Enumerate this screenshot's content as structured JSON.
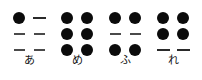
{
  "chart_data": {
    "type": "table",
    "title": "",
    "xlabel": "",
    "ylabel": "",
    "categories": [
      "あ",
      "め",
      "ふ",
      "れ"
    ],
    "dot_rows": 3,
    "dot_cols": 2,
    "legend": [],
    "colors": {
      "dot_filled": "#0b0b0b",
      "dot_empty": "#4a4a4a",
      "background": "#ffffff",
      "label_text": "#111111"
    },
    "cells": [
      {
        "label": "あ",
        "romaji": "a",
        "dots": [
          [
            1,
            0
          ],
          [
            0,
            0
          ],
          [
            0,
            0
          ]
        ],
        "raised_dot_numbers": [
          1
        ]
      },
      {
        "label": "め",
        "romaji": "me",
        "dots": [
          [
            1,
            1
          ],
          [
            1,
            1
          ],
          [
            1,
            1
          ]
        ],
        "raised_dot_numbers": [
          1,
          2,
          3,
          4,
          5,
          6
        ]
      },
      {
        "label": "ふ",
        "romaji": "fu",
        "dots": [
          [
            1,
            1
          ],
          [
            0,
            0
          ],
          [
            1,
            1
          ]
        ],
        "raised_dot_numbers": [
          1,
          3,
          4,
          6
        ]
      },
      {
        "label": "れ",
        "romaji": "re",
        "dots": [
          [
            1,
            1
          ],
          [
            1,
            1
          ],
          [
            0,
            0
          ]
        ],
        "raised_dot_numbers": [
          1,
          2,
          4,
          5
        ]
      }
    ]
  }
}
